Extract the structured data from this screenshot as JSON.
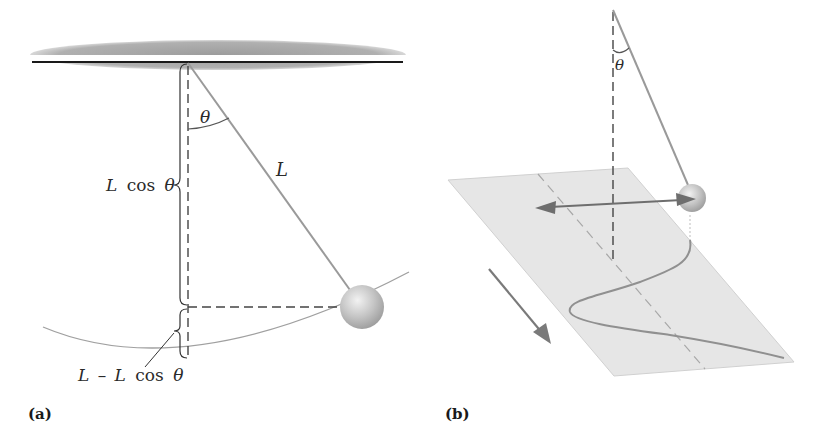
{
  "figure": {
    "panel_a": {
      "label": "(a)",
      "angle_label": "θ",
      "length_label": "L",
      "height_label_L": "L",
      "height_label_cos": "cos",
      "height_label_theta": "θ",
      "drop_label_prefix": "L",
      "drop_label_minus": "–",
      "drop_label_L": "L",
      "drop_label_cos": "cos",
      "drop_label_theta": "θ"
    },
    "panel_b": {
      "label": "(b)",
      "angle_label": "θ"
    },
    "colors": {
      "ceiling": "#a8a8a8",
      "ceiling_line": "#1a1a1a",
      "string": "#9a9a9a",
      "dashed": "#444444",
      "arc": "#a0a0a0",
      "bob": "#c8c8c8",
      "plane": "#e6e6e6",
      "arrow": "#777777",
      "trace": "#909090"
    }
  }
}
